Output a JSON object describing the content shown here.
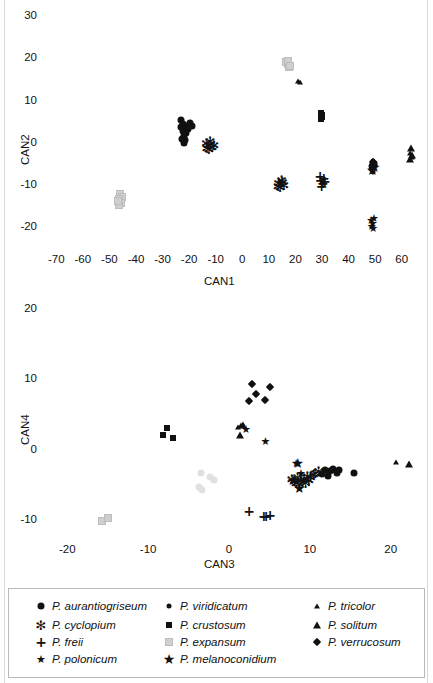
{
  "figure": {
    "type": "scatter-figure",
    "panels": [
      "CAN1 vs CAN2",
      "CAN3 vs CAN4"
    ]
  },
  "chart_data": [
    {
      "type": "scatter",
      "title": "",
      "xlabel": "CAN1",
      "ylabel": "CAN2",
      "xlim": [
        -75,
        65
      ],
      "ylim": [
        -24,
        31
      ],
      "xticks": [
        -70,
        -60,
        -50,
        -40,
        -30,
        -20,
        -10,
        0,
        10,
        20,
        30,
        40,
        50,
        60
      ],
      "yticks": [
        30,
        20,
        10,
        0,
        -10,
        -20
      ],
      "grid": false,
      "legend_position": "below-figure",
      "series": [
        {
          "name": "P. aurantiogriseum",
          "marker": "circle",
          "color": "#111111",
          "points": [
            [
              -37.5,
              8.2
            ],
            [
              -36.5,
              7.4
            ],
            [
              -36.0,
              6.4
            ],
            [
              -35.2,
              6.9
            ],
            [
              -34.6,
              6.0
            ],
            [
              -35.4,
              5.2
            ],
            [
              -36.2,
              4.4
            ],
            [
              -36.8,
              5.6
            ],
            [
              -37.2,
              6.6
            ],
            [
              -35.8,
              3.6
            ],
            [
              -36.4,
              2.9
            ],
            [
              -37.0,
              3.8
            ],
            [
              -34.0,
              7.6
            ],
            [
              -33.4,
              6.8
            ]
          ]
        },
        {
          "name": "P. cyclopium",
          "marker": "asterisk",
          "color": "#111111",
          "points": [
            [
              -27.8,
              2.9
            ],
            [
              -27.0,
              2.2
            ],
            [
              -26.2,
              2.6
            ],
            [
              -25.6,
              1.9
            ],
            [
              -26.8,
              1.3
            ],
            [
              -27.6,
              1.7
            ],
            [
              -25.0,
              2.4
            ],
            [
              -26.4,
              3.3
            ],
            [
              -0.6,
              -6.6
            ],
            [
              0.2,
              -7.0
            ],
            [
              0.9,
              -6.4
            ],
            [
              0.0,
              -7.6
            ],
            [
              -0.8,
              -7.3
            ],
            [
              1.4,
              -7.1
            ],
            [
              0.5,
              -5.9
            ]
          ]
        },
        {
          "name": "P. freii",
          "marker": "plus",
          "color": "#111111",
          "points": [
            [
              15.0,
              -5.0
            ],
            [
              15.2,
              -6.0
            ],
            [
              16.4,
              -5.6
            ],
            [
              16.0,
              -6.8
            ],
            [
              15.6,
              -7.4
            ],
            [
              16.8,
              -6.2
            ]
          ]
        },
        {
          "name": "P. polonicum",
          "marker": "star",
          "color": "#111111",
          "points": [
            [
              34.2,
              -15.4
            ],
            [
              34.8,
              -16.2
            ],
            [
              35.2,
              -15.0
            ],
            [
              34.4,
              -17.0
            ],
            [
              35.0,
              -17.4
            ]
          ]
        },
        {
          "name": "P. viridicatum",
          "marker": "circle-small",
          "color": "#111111",
          "points": [
            [
              34.6,
              -2.2
            ],
            [
              35.2,
              -2.8
            ],
            [
              34.2,
              -3.4
            ],
            [
              35.6,
              -2.0
            ],
            [
              34.8,
              -4.0
            ],
            [
              35.0,
              -1.4
            ],
            [
              34.0,
              -2.6
            ]
          ]
        },
        {
          "name": "P. crustosum",
          "marker": "square",
          "color": "#111111",
          "points": [
            [
              15.4,
              9.8
            ],
            [
              15.6,
              9.0
            ],
            [
              15.2,
              8.4
            ],
            [
              15.8,
              9.4
            ]
          ]
        },
        {
          "name": "P. expansum",
          "marker": "square-gray",
          "color": "#d2d2d2",
          "points": [
            [
              2.2,
              22.0
            ],
            [
              2.8,
              21.4
            ],
            [
              3.4,
              20.8
            ],
            [
              3.0,
              22.2
            ],
            [
              3.8,
              21.0
            ],
            [
              -60.2,
              -9.2
            ],
            [
              -59.4,
              -10.0
            ],
            [
              -60.6,
              -10.6
            ],
            [
              -59.8,
              -11.4
            ],
            [
              -60.8,
              -12.0
            ],
            [
              -61.2,
              -11.0
            ]
          ]
        },
        {
          "name": "P. melanoconidium",
          "marker": "star-large",
          "color": "#111111",
          "points": [
            [
              34.6,
              -3.6
            ],
            [
              35.4,
              -3.0
            ]
          ]
        },
        {
          "name": "P. tricolor",
          "marker": "triangle-small",
          "color": "#111111",
          "points": [
            [
              6.6,
              17.6
            ],
            [
              7.6,
              17.2
            ],
            [
              49.0,
              0.4
            ],
            [
              49.4,
              -0.6
            ]
          ]
        },
        {
          "name": "P. solitum",
          "marker": "triangle",
          "color": "#111111",
          "points": [
            [
              49.2,
              1.6
            ],
            [
              49.6,
              0.0
            ],
            [
              49.0,
              -1.0
            ]
          ]
        },
        {
          "name": "P. verrucosum",
          "marker": "diamond",
          "color": "#111111",
          "points": [
            [
              34.8,
              -1.8
            ],
            [
              35.4,
              -2.4
            ]
          ]
        }
      ]
    },
    {
      "type": "scatter",
      "title": "",
      "xlabel": "CAN3",
      "ylabel": "CAN4",
      "xlim": [
        -23,
        23
      ],
      "ylim": [
        -12,
        21
      ],
      "xticks": [
        -20,
        -10,
        0,
        10,
        20
      ],
      "yticks": [
        20,
        10,
        0,
        -10
      ],
      "grid": false,
      "legend_position": "below-figure",
      "series": [
        {
          "name": "P. aurantiogriseum",
          "marker": "circle",
          "color": "#111111",
          "points": [
            [
              7.2,
              -1.2
            ],
            [
              7.8,
              -1.4
            ],
            [
              8.2,
              -1.0
            ],
            [
              8.6,
              -1.6
            ],
            [
              7.5,
              -2.0
            ],
            [
              8.9,
              -1.2
            ],
            [
              10.8,
              -1.6
            ],
            [
              6.8,
              -1.8
            ]
          ]
        },
        {
          "name": "P. cyclopium",
          "marker": "asterisk",
          "color": "#111111",
          "points": [
            [
              3.1,
              -2.4
            ],
            [
              3.4,
              -2.8
            ],
            [
              3.8,
              -2.2
            ],
            [
              4.2,
              -2.6
            ],
            [
              4.6,
              -2.4
            ],
            [
              5.0,
              -2.0
            ],
            [
              5.4,
              -2.2
            ],
            [
              5.8,
              -1.8
            ],
            [
              4.0,
              -3.2
            ],
            [
              3.6,
              -3.0
            ],
            [
              4.8,
              -3.0
            ],
            [
              5.2,
              -2.6
            ],
            [
              6.0,
              -1.6
            ],
            [
              6.4,
              -1.4
            ]
          ]
        },
        {
          "name": "P. freii",
          "marker": "plus",
          "color": "#111111",
          "points": [
            [
              -2.2,
              -7.0
            ],
            [
              -0.4,
              -7.8
            ],
            [
              -0.1,
              -7.8
            ],
            [
              0.4,
              -7.6
            ]
          ]
        },
        {
          "name": "P. polonicum",
          "marker": "star",
          "color": "#111111",
          "points": [
            [
              -2.6,
              4.6
            ],
            [
              -0.2,
              3.0
            ],
            [
              3.6,
              -0.2
            ],
            [
              3.4,
              -2.6
            ],
            [
              4.0,
              -3.8
            ],
            [
              4.4,
              -2.8
            ],
            [
              4.2,
              -1.6
            ]
          ]
        },
        {
          "name": "P. viridicatum",
          "marker": "circle-small",
          "color": "#111111",
          "points": [
            [
              8.0,
              -1.0
            ],
            [
              8.4,
              -1.4
            ],
            [
              8.8,
              -1.2
            ]
          ]
        },
        {
          "name": "P. crustosum",
          "marker": "square",
          "color": "#111111",
          "points": [
            [
              -12.4,
              4.8
            ],
            [
              -12.8,
              3.8
            ],
            [
              -11.6,
              3.4
            ]
          ]
        },
        {
          "name": "P. expansum",
          "marker": "square-gray",
          "color": "#d2d2d2",
          "points": [
            [
              -20.4,
              -8.4
            ],
            [
              -19.6,
              -8.0
            ]
          ]
        },
        {
          "name": "P. expansum-circles",
          "marker": "circle-gray",
          "color": "#e2e2e2",
          "points": [
            [
              -8.2,
              -1.6
            ],
            [
              -6.6,
              -2.6
            ],
            [
              -8.4,
              -3.6
            ],
            [
              -8.0,
              -4.0
            ],
            [
              -7.0,
              -2.2
            ]
          ]
        },
        {
          "name": "P. melanoconidium",
          "marker": "star-large",
          "color": "#111111",
          "points": [
            [
              3.8,
              -0.2
            ],
            [
              3.2,
              -2.6
            ],
            [
              4.0,
              -3.8
            ]
          ]
        },
        {
          "name": "P. tricolor",
          "marker": "triangle-small",
          "color": "#111111",
          "points": [
            [
              -3.6,
              4.9
            ],
            [
              -3.2,
              5.2
            ],
            [
              16.0,
              -0.1
            ]
          ]
        },
        {
          "name": "P. solitum",
          "marker": "triangle",
          "color": "#111111",
          "points": [
            [
              -3.0,
              5.2
            ],
            [
              -3.4,
              3.8
            ],
            [
              17.6,
              -0.4
            ]
          ]
        },
        {
          "name": "P. verrucosum",
          "marker": "diamond",
          "color": "#111111",
          "points": [
            [
              -1.8,
              11.0
            ],
            [
              -1.4,
              9.6
            ],
            [
              0.4,
              10.6
            ],
            [
              -2.2,
              8.6
            ],
            [
              -0.2,
              8.8
            ]
          ]
        }
      ]
    }
  ],
  "legend": {
    "columns": [
      [
        {
          "label": "P. aurantiogriseum",
          "marker": "circle"
        },
        {
          "label": "P. cyclopium",
          "marker": "asterisk"
        },
        {
          "label": "P. freii",
          "marker": "plus"
        },
        {
          "label": "P. polonicum",
          "marker": "star"
        }
      ],
      [
        {
          "label": "P. viridicatum",
          "marker": "circle-small"
        },
        {
          "label": "P. crustosum",
          "marker": "square"
        },
        {
          "label": "P. expansum",
          "marker": "square-gray"
        },
        {
          "label": "P. melanoconidium",
          "marker": "star-large"
        }
      ],
      [
        {
          "label": "P. tricolor",
          "marker": "triangle-small"
        },
        {
          "label": "P. solitum",
          "marker": "triangle"
        },
        {
          "label": "P. verrucosum",
          "marker": "diamond"
        }
      ]
    ]
  }
}
